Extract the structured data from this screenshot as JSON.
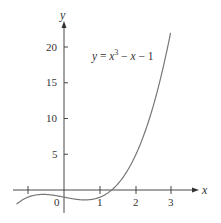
{
  "chart_data": {
    "type": "line",
    "title": "",
    "annotation": "y = x^3 − x − 1",
    "xlabel": "x",
    "ylabel": "y",
    "xlim": [
      -1.4,
      3.6
    ],
    "ylim": [
      -3,
      25
    ],
    "x_ticks": [
      -1,
      1,
      2,
      3
    ],
    "x_tick_labels": [
      "",
      "1",
      "2",
      "3"
    ],
    "origin_label": "0",
    "y_ticks": [
      5,
      10,
      15,
      20
    ],
    "y_tick_labels": [
      "5",
      "10",
      "15",
      "20"
    ],
    "grid": false,
    "legend": "none",
    "series": [
      {
        "name": "y = x^3 − x − 1",
        "function": "x^3 - x - 1",
        "x": [
          -1.3,
          -1,
          -0.5,
          0,
          0.5,
          1,
          1.5,
          2,
          2.5,
          3
        ],
        "values": [
          -1.897,
          -1,
          -0.625,
          -1,
          -1.375,
          -1,
          0.875,
          5,
          11.125,
          23
        ]
      }
    ]
  },
  "labels": {
    "x_axis": "x",
    "y_axis": "y",
    "origin": "0",
    "x_tick_1": "1",
    "x_tick_2": "2",
    "x_tick_3": "3",
    "y_tick_5": "5",
    "y_tick_10": "10",
    "y_tick_15": "15",
    "y_tick_20": "20",
    "eq_y": "y",
    "eq_eq": " = ",
    "eq_x": "x",
    "eq_exp": "3",
    "eq_rest1": " − ",
    "eq_x2": "x",
    "eq_rest2": " − 1"
  },
  "colors": {
    "axis": "#333333",
    "curve": "#777777",
    "text": "#333333"
  }
}
